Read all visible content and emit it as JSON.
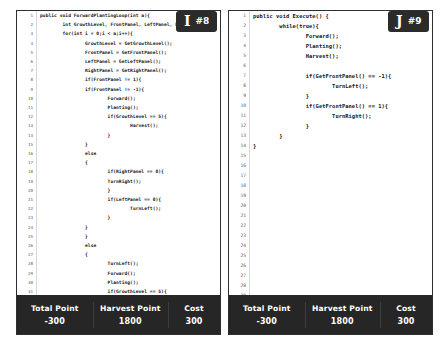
{
  "panels": [
    {
      "badge": {
        "letter": "I",
        "number": "#8"
      },
      "code_lines": [
        {
          "n": "1",
          "text": "public void ForwardPlantingLoop(int a){"
        },
        {
          "n": "2",
          "text": "        int GrowthLevel, FrontPanel, LeftPanel, RightPanel;"
        },
        {
          "n": "3",
          "text": "        for(int i = 0;i < a;i++){"
        },
        {
          "n": "4",
          "text": "                GrowthLevel = GetGrowthLevel();"
        },
        {
          "n": "5",
          "text": "                FrontPanel = GetFrontPanel();"
        },
        {
          "n": "6",
          "text": "                LeftPanel = GetLeftPanel();"
        },
        {
          "n": "7",
          "text": "                RightPanel = GetRightPanel();"
        },
        {
          "n": "8",
          "text": "                if(FrontPanel != 1){"
        },
        {
          "n": "9",
          "text": "                if(FrontPanel != -1){"
        },
        {
          "n": "10",
          "text": "                        Forward();"
        },
        {
          "n": "11",
          "text": "                        Planting();"
        },
        {
          "n": "12",
          "text": "                        if(GrowthLevel == 5){"
        },
        {
          "n": "13",
          "text": "                                Harvest();"
        },
        {
          "n": "14",
          "text": "                        }"
        },
        {
          "n": "15",
          "text": "                }"
        },
        {
          "n": "16",
          "text": "                else"
        },
        {
          "n": "17",
          "text": "                {"
        },
        {
          "n": "18",
          "text": "                        if(RightPanel == 0){"
        },
        {
          "n": "19",
          "text": "                        TurnRight();"
        },
        {
          "n": "20",
          "text": "                        }"
        },
        {
          "n": "21",
          "text": "                        if(LeftPanel == 0){"
        },
        {
          "n": "22",
          "text": "                                TurnLeft();"
        },
        {
          "n": "23",
          "text": "                        }"
        },
        {
          "n": "24",
          "text": "                }"
        },
        {
          "n": "25",
          "text": "                }"
        },
        {
          "n": "26",
          "text": "                else"
        },
        {
          "n": "27",
          "text": "                {"
        },
        {
          "n": "28",
          "text": "                        TurnLeft();"
        },
        {
          "n": "29",
          "text": "                        Forward();"
        },
        {
          "n": "30",
          "text": "                        Planting();"
        },
        {
          "n": "31",
          "text": "                        if(GrowthLevel == 5){"
        },
        {
          "n": "32",
          "text": "                                Harvest();"
        },
        {
          "n": "33",
          "text": "                        }"
        },
        {
          "n": "34",
          "text": "                }"
        },
        {
          "n": "35",
          "text": "        }"
        },
        {
          "n": "36",
          "text": "}"
        },
        {
          "n": "37",
          "text": "public void Execute() {"
        }
      ],
      "stats": [
        {
          "label": "Total Point",
          "value": "-300"
        },
        {
          "label": "Harvest Point",
          "value": "1800"
        },
        {
          "label": "Cost",
          "value": "300"
        }
      ]
    },
    {
      "badge": {
        "letter": "J",
        "number": "#9"
      },
      "code_lines": [
        {
          "n": "1",
          "text": "public void Execute() {"
        },
        {
          "n": "2",
          "text": "        while(true){"
        },
        {
          "n": "3",
          "text": "                Forward();"
        },
        {
          "n": "4",
          "text": "                Planting();"
        },
        {
          "n": "5",
          "text": "                Harvest();"
        },
        {
          "n": "6",
          "text": ""
        },
        {
          "n": "7",
          "text": "                if(GetFrontPanel() == -1){"
        },
        {
          "n": "8",
          "text": "                        TurnLeft();"
        },
        {
          "n": "9",
          "text": "                }"
        },
        {
          "n": "10",
          "text": "                if(GetFrontPanel() == 1){"
        },
        {
          "n": "11",
          "text": "                        TurnRight();"
        },
        {
          "n": "12",
          "text": "                }"
        },
        {
          "n": "13",
          "text": "        }"
        },
        {
          "n": "14",
          "text": "}"
        },
        {
          "n": "15",
          "text": ""
        },
        {
          "n": "16",
          "text": ""
        },
        {
          "n": "17",
          "text": ""
        },
        {
          "n": "18",
          "text": ""
        },
        {
          "n": "19",
          "text": ""
        },
        {
          "n": "20",
          "text": ""
        },
        {
          "n": "21",
          "text": ""
        },
        {
          "n": "22",
          "text": ""
        },
        {
          "n": "23",
          "text": ""
        },
        {
          "n": "24",
          "text": ""
        },
        {
          "n": "25",
          "text": ""
        },
        {
          "n": "26",
          "text": ""
        },
        {
          "n": "27",
          "text": ""
        },
        {
          "n": "28",
          "text": ""
        },
        {
          "n": "29",
          "text": ""
        },
        {
          "n": "30",
          "text": ""
        },
        {
          "n": "31",
          "text": ""
        },
        {
          "n": "32",
          "text": ""
        },
        {
          "n": "33",
          "text": ""
        },
        {
          "n": "34",
          "text": ""
        },
        {
          "n": "35",
          "text": ""
        },
        {
          "n": "36",
          "text": ""
        },
        {
          "n": "37",
          "text": ""
        }
      ],
      "stats": [
        {
          "label": "Total Point",
          "value": "-300"
        },
        {
          "label": "Harvest Point",
          "value": "1800"
        },
        {
          "label": "Cost",
          "value": "300"
        }
      ]
    }
  ]
}
